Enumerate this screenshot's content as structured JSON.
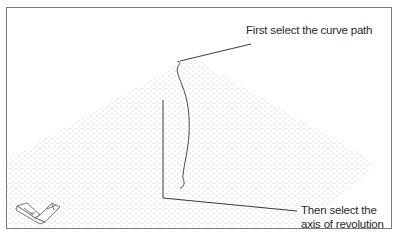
{
  "callouts": {
    "curve": "First select the curve path",
    "axis_line1": "Then select the",
    "axis_line2": "axis of revolution"
  },
  "colors": {
    "border": "#7a7a7a",
    "line": "#3a3a3a",
    "grid_dot": "#b8b8b8",
    "text": "#2a2a2a"
  },
  "icons": {
    "ucs": "ucs-icon"
  }
}
